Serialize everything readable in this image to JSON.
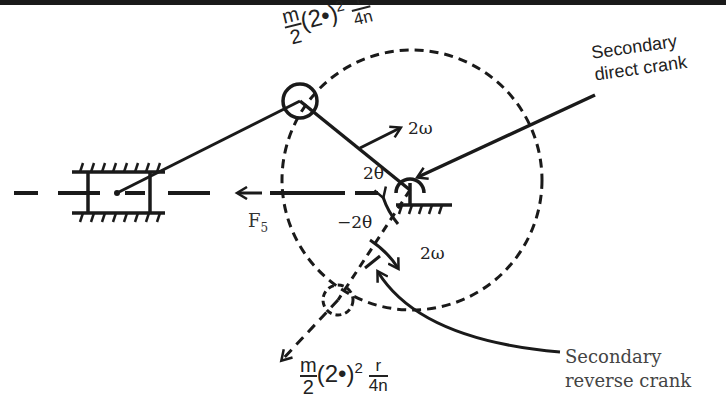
{
  "diagram": {
    "labels": {
      "top_mass_numerator": "m",
      "top_mass_denominator": "2",
      "top_mass_base": "(2•)",
      "top_mass_exp": "2",
      "top_frac_num": "r",
      "top_frac_den": "4n",
      "bottom_mass_numerator": "m",
      "bottom_mass_denominator": "2",
      "bottom_mass_base": "(2•)",
      "bottom_mass_exp": "2",
      "bottom_frac_num": "r",
      "bottom_frac_den": "4n",
      "secondary_direct_line1": "Secondary",
      "secondary_direct_line2": "direct crank",
      "secondary_reverse_line1": "Secondary",
      "secondary_reverse_line2": "reverse crank",
      "omega_direct": "2ω",
      "omega_reverse": "2ω",
      "theta_direct": "2θ",
      "theta_reverse": "−2θ",
      "force": "F",
      "force_sub": "5"
    },
    "colors": {
      "stroke": "#1a1a1a",
      "text": "#222222",
      "background": "#ffffff"
    }
  }
}
